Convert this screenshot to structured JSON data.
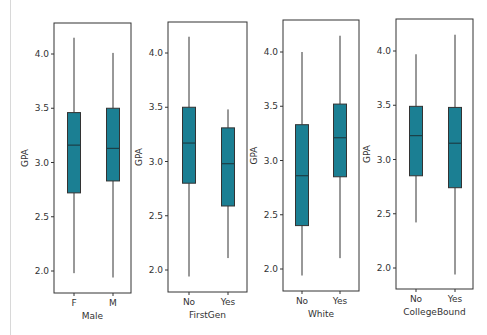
{
  "figure": {
    "box_color": "#1b7f93",
    "line_color": "#333333",
    "ylabel": "GPA",
    "yticks": [
      "2.0",
      "2.5",
      "3.0",
      "3.5",
      "4.0"
    ]
  },
  "chart_data": [
    {
      "type": "box",
      "xlabel": "Male",
      "ylabel": "GPA",
      "ylim": [
        1.8,
        4.3
      ],
      "yticks": [
        2.0,
        2.5,
        3.0,
        3.5,
        4.0
      ],
      "categories": [
        "F",
        "M"
      ],
      "boxes": [
        {
          "label": "F",
          "whisker_low": 1.98,
          "q1": 2.72,
          "median": 3.16,
          "q3": 3.46,
          "whisker_high": 4.15
        },
        {
          "label": "M",
          "whisker_low": 1.94,
          "q1": 2.83,
          "median": 3.13,
          "q3": 3.5,
          "whisker_high": 4.01
        }
      ]
    },
    {
      "type": "box",
      "xlabel": "FirstGen",
      "ylabel": "GPA",
      "ylim": [
        1.8,
        4.3
      ],
      "yticks": [
        2.0,
        2.5,
        3.0,
        3.5,
        4.0
      ],
      "categories": [
        "No",
        "Yes"
      ],
      "boxes": [
        {
          "label": "No",
          "whisker_low": 1.94,
          "q1": 2.8,
          "median": 3.17,
          "q3": 3.5,
          "whisker_high": 4.15
        },
        {
          "label": "Yes",
          "whisker_low": 2.11,
          "q1": 2.59,
          "median": 2.98,
          "q3": 3.31,
          "whisker_high": 3.48
        }
      ]
    },
    {
      "type": "box",
      "xlabel": "White",
      "ylabel": "GPA",
      "ylim": [
        1.8,
        4.3
      ],
      "yticks": [
        2.0,
        2.5,
        3.0,
        3.5,
        4.0
      ],
      "categories": [
        "No",
        "Yes"
      ],
      "boxes": [
        {
          "label": "No",
          "whisker_low": 1.94,
          "q1": 2.4,
          "median": 2.86,
          "q3": 3.33,
          "whisker_high": 4.0
        },
        {
          "label": "Yes",
          "whisker_low": 2.1,
          "q1": 2.85,
          "median": 3.21,
          "q3": 3.52,
          "whisker_high": 4.15
        }
      ]
    },
    {
      "type": "box",
      "xlabel": "CollegeBound",
      "ylabel": "GPA",
      "ylim": [
        1.8,
        4.3
      ],
      "yticks": [
        2.0,
        2.5,
        3.0,
        3.5,
        4.0
      ],
      "categories": [
        "No",
        "Yes"
      ],
      "boxes": [
        {
          "label": "No",
          "whisker_low": 2.42,
          "q1": 2.85,
          "median": 3.22,
          "q3": 3.49,
          "whisker_high": 3.97
        },
        {
          "label": "Yes",
          "whisker_low": 1.94,
          "q1": 2.74,
          "median": 3.15,
          "q3": 3.48,
          "whisker_high": 4.15
        }
      ]
    }
  ]
}
